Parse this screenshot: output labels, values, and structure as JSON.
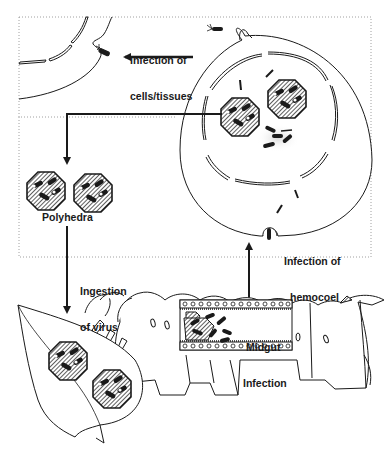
{
  "diagram": {
    "colors": {
      "stroke": "#1a1a1a",
      "background": "#ffffff",
      "dotted_box": "#888888"
    },
    "labels": {
      "infection_cells_line1": "Infection of",
      "infection_cells_line2": "cells/tissues",
      "polyhedra": "Polyhedra",
      "ingestion_line1": "Ingestion",
      "ingestion_line2": "of virus",
      "hemocoel_line1": "Infection of",
      "hemocoel_line2": "hemocoel",
      "midgut_line1": "Midgut",
      "midgut_line2": "Infection"
    },
    "nodes": [
      {
        "id": "infected-cell",
        "description": "Large cell with nucleus containing polyhedra and virions"
      },
      {
        "id": "neighbor-cell",
        "description": "Partial neighboring cell being infected (top-left)"
      },
      {
        "id": "polyhedra",
        "description": "Two released polyhedral occlusion bodies"
      },
      {
        "id": "leaf",
        "description": "Leaf contaminated with polyhedra"
      },
      {
        "id": "caterpillar",
        "description": "Larva with midgut cross-section showing infection"
      }
    ],
    "edges": [
      {
        "from": "infected-cell",
        "to": "neighbor-cell",
        "label": "Infection of cells/tissues"
      },
      {
        "from": "infected-cell",
        "to": "polyhedra",
        "label": ""
      },
      {
        "from": "polyhedra",
        "to": "leaf",
        "label": "Ingestion of virus"
      },
      {
        "from": "caterpillar",
        "to": "infected-cell",
        "label": "Infection of hemocoel"
      }
    ]
  }
}
